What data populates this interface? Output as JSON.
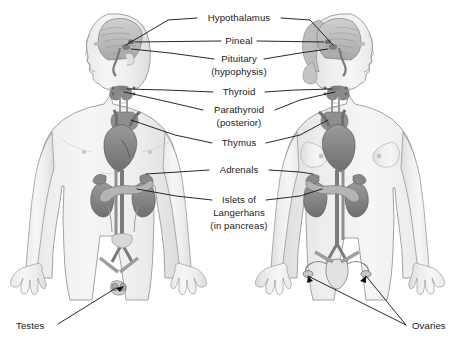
{
  "figure": {
    "type": "anatomical-diagram",
    "background_color": "#ffffff",
    "label_color": "#1b1b1b",
    "leader_line_color": "#111111",
    "figures": [
      {
        "id": "male",
        "side": "left",
        "facing": "left",
        "description": "Male body, anterior view with sagittal head section"
      },
      {
        "id": "female",
        "side": "right",
        "facing": "right",
        "description": "Female body, anterior view with sagittal head section"
      }
    ]
  },
  "labels": {
    "hypothalamus": "Hypothalamus",
    "pineal": "Pineal",
    "pituitary": "Pituitary",
    "pituitary_sub": "(hypophysis)",
    "thyroid": "Thyroid",
    "parathyroid": "Parathyroid",
    "parathyroid_sub": "(posterior)",
    "thymus": "Thymus",
    "adrenals": "Adrenals",
    "islets_1": "Islets of",
    "islets_2": "Langerhans",
    "islets_3": "(in pancreas)",
    "testes": "Testes",
    "ovaries": "Ovaries"
  },
  "callouts": [
    {
      "name": "hypothalamus",
      "text": "Hypothalamus",
      "x": 239,
      "y": 18,
      "align": "center",
      "lines": [
        "left",
        "right"
      ]
    },
    {
      "name": "pineal",
      "text": "Pineal",
      "x": 239,
      "y": 41,
      "align": "center",
      "lines": [
        "left",
        "right"
      ]
    },
    {
      "name": "pituitary",
      "text": "Pituitary",
      "x": 239,
      "y": 59,
      "align": "center",
      "lines": [
        "left",
        "right"
      ]
    },
    {
      "name": "thyroid",
      "text": "Thyroid",
      "x": 239,
      "y": 92,
      "align": "center",
      "lines": [
        "left",
        "right"
      ]
    },
    {
      "name": "parathyroid",
      "text": "Parathyroid",
      "x": 239,
      "y": 110,
      "align": "center",
      "lines": [
        "left",
        "right"
      ]
    },
    {
      "name": "thymus",
      "text": "Thymus",
      "x": 239,
      "y": 143,
      "align": "center",
      "lines": [
        "left",
        "right"
      ]
    },
    {
      "name": "adrenals",
      "text": "Adrenals",
      "x": 239,
      "y": 170,
      "align": "center",
      "lines": [
        "left",
        "right"
      ]
    },
    {
      "name": "islets",
      "text": "Islets of Langerhans (in pancreas)",
      "x": 239,
      "y": 200,
      "align": "center",
      "lines": [
        "left",
        "right"
      ]
    },
    {
      "name": "testes",
      "text": "Testes",
      "x": 16,
      "y": 327,
      "align": "left",
      "lines": [
        "right"
      ]
    },
    {
      "name": "ovaries",
      "text": "Ovaries",
      "x": 412,
      "y": 327,
      "align": "left",
      "lines": [
        "left"
      ]
    }
  ],
  "glands": [
    {
      "name": "hypothalamus",
      "figure": "both",
      "region": "brain"
    },
    {
      "name": "pineal",
      "figure": "both",
      "region": "brain"
    },
    {
      "name": "pituitary",
      "figure": "both",
      "region": "brain"
    },
    {
      "name": "thyroid",
      "figure": "both",
      "region": "neck"
    },
    {
      "name": "parathyroid",
      "figure": "both",
      "region": "neck-posterior"
    },
    {
      "name": "thymus",
      "figure": "both",
      "region": "upper-chest"
    },
    {
      "name": "adrenals",
      "figure": "both",
      "region": "above-kidneys"
    },
    {
      "name": "pancreatic-islets",
      "figure": "both",
      "region": "abdomen"
    },
    {
      "name": "testes",
      "figure": "male",
      "region": "pelvis"
    },
    {
      "name": "ovaries",
      "figure": "female",
      "region": "pelvis"
    }
  ]
}
